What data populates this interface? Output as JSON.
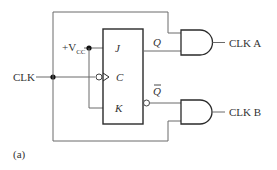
{
  "diagram": {
    "caption": "(a)",
    "inputs": {
      "clk_label": "CLK",
      "vcc_prefix": "+V",
      "vcc_subscript": "CC"
    },
    "flip_flop": {
      "type": "JK flip-flop",
      "pins": {
        "j": "J",
        "c": "C",
        "k": "K",
        "q": "Q",
        "q_bar": "Q"
      },
      "clock_edge": "negative"
    },
    "gates": [
      {
        "type": "AND",
        "output_label": "CLK A",
        "inputs": [
          "CLK",
          "Q"
        ]
      },
      {
        "type": "AND",
        "output_label": "CLK B",
        "inputs": [
          "Q-bar",
          "CLK"
        ]
      }
    ],
    "colors": {
      "wire": "#6a6a6a",
      "outline": "#2a2a2a",
      "text": "#333333"
    }
  }
}
